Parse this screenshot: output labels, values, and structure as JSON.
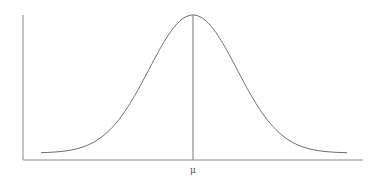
{
  "chart_data": {
    "type": "line",
    "xlabel": "",
    "ylabel": "",
    "grid": false,
    "legend": null,
    "series": [
      {
        "name": "normal density",
        "mean": 0,
        "std": 1,
        "x": [
          -3.5,
          -3,
          -2.5,
          -2,
          -1.5,
          -1,
          -0.5,
          0,
          0.5,
          1,
          1.5,
          2,
          2.5,
          3,
          3.5
        ],
        "y": [
          0.0009,
          0.0044,
          0.0175,
          0.054,
          0.1295,
          0.242,
          0.3521,
          0.3989,
          0.3521,
          0.242,
          0.1295,
          0.054,
          0.0175,
          0.0044,
          0.0009
        ]
      }
    ],
    "annotations": [
      {
        "type": "vertical-line",
        "x": 0,
        "label": "μ"
      }
    ],
    "tick_labels": {
      "x": [
        "μ"
      ]
    },
    "xlim": [
      -4,
      4
    ]
  },
  "labels": {
    "mean": "μ"
  },
  "colors": {
    "curve": "#6e6e6e",
    "axes": "#8a8a8a",
    "mean_line": "#777777"
  },
  "layout": {
    "origin_x": 23,
    "axis_y": 160,
    "axis_top": 15,
    "axis_right": 363,
    "center_x": 193,
    "baseline_y": 153,
    "peak_y": 15,
    "sigma_px": 44,
    "curve_left": 41,
    "curve_right": 347
  }
}
